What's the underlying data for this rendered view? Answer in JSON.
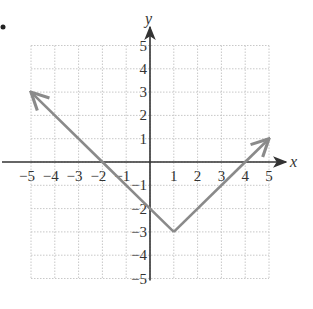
{
  "chart_data": {
    "type": "line",
    "title": "",
    "function": "y = |x - 1| - 3",
    "xlabel": "x",
    "ylabel": "y",
    "xlim": [
      -5,
      5
    ],
    "ylim": [
      -5,
      5
    ],
    "grid": true,
    "x_ticks": [
      "-5",
      "-4",
      "-3",
      "-2",
      "-1",
      "1",
      "2",
      "3",
      "4",
      "5"
    ],
    "y_ticks": [
      "5",
      "4",
      "3",
      "2",
      "1",
      "-1",
      "-2",
      "-3",
      "-4",
      "-5"
    ],
    "series": [
      {
        "name": "y = |x - 1| - 3",
        "color": "#8a8a8a",
        "arrows_at_ends": true,
        "points": [
          [
            -5,
            3
          ],
          [
            -2,
            0
          ],
          [
            0,
            -2
          ],
          [
            1,
            -3
          ],
          [
            4,
            0
          ],
          [
            5,
            1
          ]
        ]
      }
    ],
    "vertex": [
      1,
      -3
    ],
    "x_intercepts": [
      -2,
      4
    ],
    "y_intercept": -2
  },
  "colors": {
    "axis": "#333333",
    "grid": "#c8c8c8",
    "curve": "#8a8a8a"
  },
  "labels": {
    "x_axis": "x",
    "y_axis": "y",
    "bullet": "•"
  }
}
